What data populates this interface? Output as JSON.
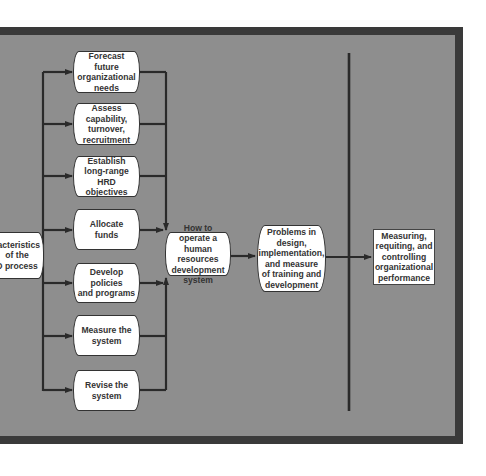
{
  "diagram": {
    "colors": {
      "background": "#8e8e8e",
      "frame_border": "#3a3a3a",
      "box_fill": "#ffffff",
      "line": "#2a2a2a",
      "text": "#333333"
    },
    "source_box": {
      "label": "racteristics\nof the\nD process"
    },
    "process_steps": [
      {
        "label": "Forecast future\norganizational\nneeds"
      },
      {
        "label": "Assess\ncapability,\nturnover,\nrecruitment"
      },
      {
        "label": "Establish\nlong-range HRD\nobjectives"
      },
      {
        "label": "Allocate\nfunds"
      },
      {
        "label": "Develop policies\nand programs"
      },
      {
        "label": "Measure the\nsystem"
      },
      {
        "label": "Revise the\nsystem"
      }
    ],
    "hub_box": {
      "label": "How to operate a\nhuman resources\ndevelopment\nsystem"
    },
    "problems_box": {
      "label": "Problems in\ndesign,\nimplementation,\nand measure\nof training and\ndevelopment"
    },
    "outcome_box": {
      "label": "Measuring,\nrequiting, and\ncontrolling\norganizational\nperformance"
    }
  }
}
